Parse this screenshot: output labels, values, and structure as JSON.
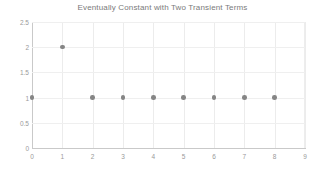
{
  "chart_data": {
    "type": "scatter",
    "title": "Eventually Constant with Two Transient Terms",
    "xlabel": "",
    "ylabel": "",
    "x": [
      0,
      1,
      2,
      3,
      4,
      5,
      6,
      7,
      8
    ],
    "values": [
      1,
      2,
      1,
      1,
      1,
      1,
      1,
      1,
      1
    ],
    "series": [
      {
        "name": "sequence",
        "points": [
          {
            "x": 0,
            "y": 1
          },
          {
            "x": 1,
            "y": 2
          },
          {
            "x": 2,
            "y": 1
          },
          {
            "x": 3,
            "y": 1
          },
          {
            "x": 4,
            "y": 1
          },
          {
            "x": 5,
            "y": 1
          },
          {
            "x": 6,
            "y": 1
          },
          {
            "x": 7,
            "y": 1
          },
          {
            "x": 8,
            "y": 1
          }
        ],
        "marker_color": "#858585"
      }
    ],
    "xlim": [
      0,
      9
    ],
    "ylim": [
      0,
      2.5
    ],
    "xticks": [
      0,
      1,
      2,
      3,
      4,
      5,
      6,
      7,
      8,
      9
    ],
    "xtick_labels": [
      "0",
      "1",
      "2",
      "3",
      "4",
      "5",
      "6",
      "7",
      "8",
      "9"
    ],
    "yticks": [
      0,
      0.5,
      1,
      1.5,
      2,
      2.5
    ],
    "ytick_labels": [
      "0",
      "0.5",
      "1",
      "1.5",
      "2",
      "2.5"
    ],
    "grid": true,
    "legend": false,
    "legend_position": "none",
    "background_color": "#ffffff",
    "grid_color": "#ececec",
    "axis_color": "#c9c9c9",
    "title_color": "#7a7a7a",
    "tick_label_color": "#9a9a9a"
  }
}
